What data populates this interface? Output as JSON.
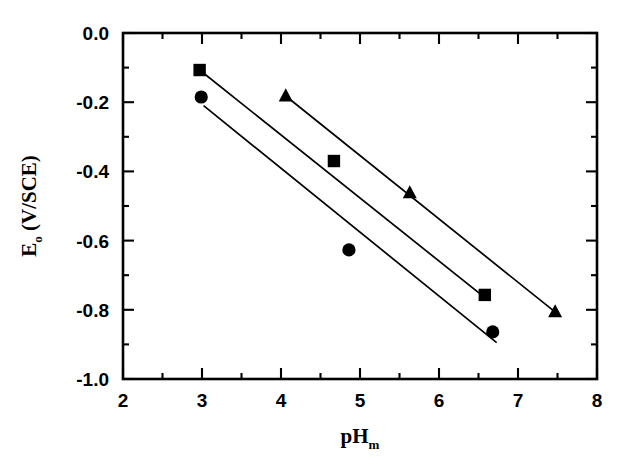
{
  "chart_data": {
    "type": "scatter",
    "title": "",
    "xlabel": "pH m",
    "xlabel_main": "pH",
    "xlabel_sub": "m",
    "ylabel": "E o (V/SCE)",
    "ylabel_main": "E",
    "ylabel_sub": "o",
    "ylabel_rest": " (V/SCE)",
    "xlim": [
      2,
      8
    ],
    "ylim": [
      -1.0,
      0.0
    ],
    "xticks": [
      2,
      3,
      4,
      5,
      6,
      7,
      8
    ],
    "xtick_labels": [
      "2",
      "3",
      "4",
      "5",
      "6",
      "7",
      "8"
    ],
    "xminor_step": 0.5,
    "yticks": [
      0.0,
      -0.2,
      -0.4,
      -0.6,
      -0.8,
      -1.0
    ],
    "ytick_labels": [
      "0.0",
      "-0.2",
      "-0.4",
      "-0.6",
      "-0.8",
      "-1.0"
    ],
    "yminor_step": 0.1,
    "grid": false,
    "legend": "none",
    "frame": "box",
    "tick_direction": "in",
    "marker_color": "#000000",
    "line_color": "#000000",
    "background": "#ffffff",
    "series": [
      {
        "name": "squares",
        "marker": "square",
        "points": [
          {
            "x": 2.97,
            "y": -0.107
          },
          {
            "x": 4.67,
            "y": -0.37
          },
          {
            "x": 6.58,
            "y": -0.757
          }
        ],
        "fit_line": {
          "x1": 2.97,
          "y1": -0.107,
          "x2": 6.62,
          "y2": -0.772
        }
      },
      {
        "name": "circles",
        "marker": "circle",
        "points": [
          {
            "x": 2.99,
            "y": -0.185
          },
          {
            "x": 4.86,
            "y": -0.627
          },
          {
            "x": 6.68,
            "y": -0.864
          }
        ],
        "fit_line": {
          "x1": 3.02,
          "y1": -0.21,
          "x2": 6.73,
          "y2": -0.895
        }
      },
      {
        "name": "triangles",
        "marker": "triangle",
        "points": [
          {
            "x": 4.06,
            "y": -0.182
          },
          {
            "x": 5.63,
            "y": -0.462
          },
          {
            "x": 7.47,
            "y": -0.806
          }
        ],
        "fit_line": {
          "x1": 4.06,
          "y1": -0.182,
          "x2": 7.5,
          "y2": -0.812
        }
      }
    ]
  }
}
